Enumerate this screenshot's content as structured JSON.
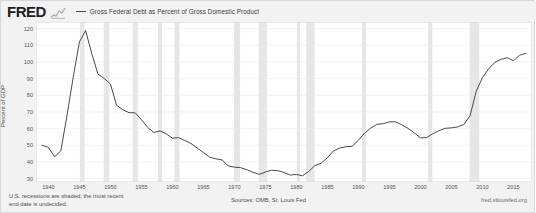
{
  "brand": {
    "logo_text": "FRED",
    "logo_icon": "spark-line-icon"
  },
  "legend": {
    "series_label": "Gross Federal Debt as Percent of Gross Domestic Product",
    "line_color": "#4a4a4a"
  },
  "footer": {
    "note_line1": "U.S. recessions are shaded; the most recent",
    "note_line2": "end date is undecided.",
    "sources": "Sources: OMB, St. Louis Fed",
    "attribution": "fred.stlouisfed.org"
  },
  "chart_data": {
    "type": "line",
    "title": "Gross Federal Debt as Percent of Gross Domestic Product",
    "xlabel": "",
    "ylabel": "Percent of GDP",
    "grid": true,
    "legend_position": "top",
    "xlim": [
      1938,
      2018
    ],
    "ylim": [
      28,
      124
    ],
    "yticks": [
      120,
      110,
      100,
      90,
      80,
      70,
      60,
      50,
      40,
      30
    ],
    "xticks": [
      1940,
      1945,
      1950,
      1955,
      1960,
      1965,
      1970,
      1975,
      1980,
      1985,
      1990,
      1995,
      2000,
      2005,
      2010,
      2015
    ],
    "series": [
      {
        "name": "Gross Federal Debt as Percent of Gross Domestic Product",
        "color": "#4a4a4a",
        "x": [
          1939,
          1940,
          1941,
          1942,
          1943,
          1944,
          1945,
          1946,
          1947,
          1948,
          1949,
          1950,
          1951,
          1952,
          1953,
          1954,
          1955,
          1956,
          1957,
          1958,
          1959,
          1960,
          1961,
          1962,
          1963,
          1964,
          1965,
          1966,
          1967,
          1968,
          1969,
          1970,
          1971,
          1972,
          1973,
          1974,
          1975,
          1976,
          1977,
          1978,
          1979,
          1980,
          1981,
          1982,
          1983,
          1984,
          1985,
          1986,
          1987,
          1988,
          1989,
          1990,
          1991,
          1992,
          1993,
          1994,
          1995,
          1996,
          1997,
          1998,
          1999,
          2000,
          2001,
          2002,
          2003,
          2004,
          2005,
          2006,
          2007,
          2008,
          2009,
          2010,
          2011,
          2012,
          2013,
          2014,
          2015,
          2016,
          2017
        ],
        "values": [
          50.0,
          48.8,
          43.1,
          46.6,
          67.9,
          90.8,
          112.0,
          118.9,
          105.0,
          92.7,
          90.1,
          86.9,
          74.0,
          71.4,
          69.6,
          69.5,
          65.4,
          60.8,
          57.7,
          58.7,
          56.9,
          54.3,
          54.6,
          52.9,
          51.1,
          48.4,
          45.7,
          42.9,
          41.9,
          41.3,
          37.7,
          36.9,
          36.6,
          35.4,
          33.8,
          32.6,
          34.0,
          35.1,
          34.8,
          33.7,
          32.2,
          32.5,
          31.7,
          34.4,
          37.9,
          39.3,
          42.6,
          46.7,
          48.4,
          49.2,
          49.4,
          53.1,
          57.3,
          60.4,
          62.6,
          63.0,
          64.1,
          64.1,
          62.3,
          60.2,
          57.5,
          54.5,
          54.6,
          57.0,
          58.8,
          60.2,
          60.5,
          61.0,
          62.5,
          67.7,
          82.4,
          90.6,
          95.8,
          99.8,
          101.6,
          102.6,
          100.8,
          104.1,
          105.2
        ]
      }
    ],
    "recession_bands": [
      {
        "start": 1945.08,
        "end": 1945.83
      },
      {
        "start": 1948.92,
        "end": 1949.83
      },
      {
        "start": 1953.58,
        "end": 1954.42
      },
      {
        "start": 1957.67,
        "end": 1958.33
      },
      {
        "start": 1960.33,
        "end": 1961.17
      },
      {
        "start": 1969.92,
        "end": 1970.92
      },
      {
        "start": 1973.92,
        "end": 1975.25
      },
      {
        "start": 1980.08,
        "end": 1980.58
      },
      {
        "start": 1981.58,
        "end": 1982.92
      },
      {
        "start": 1990.58,
        "end": 1991.25
      },
      {
        "start": 2001.25,
        "end": 2001.92
      },
      {
        "start": 2007.92,
        "end": 2009.5
      }
    ],
    "recession_band_color": "#e6e6e6"
  }
}
